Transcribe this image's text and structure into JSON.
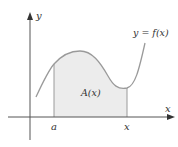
{
  "diagram": {
    "axes": {
      "x_label": "x",
      "y_label": "y"
    },
    "curve_label": "y = f(x)",
    "region_label": "A(x)",
    "markers": [
      {
        "label": "a"
      },
      {
        "label": "x"
      }
    ],
    "colors": {
      "axis": "#555555",
      "curve": "#9a9a9a",
      "fill": "#ececec",
      "text": "#333333"
    }
  }
}
